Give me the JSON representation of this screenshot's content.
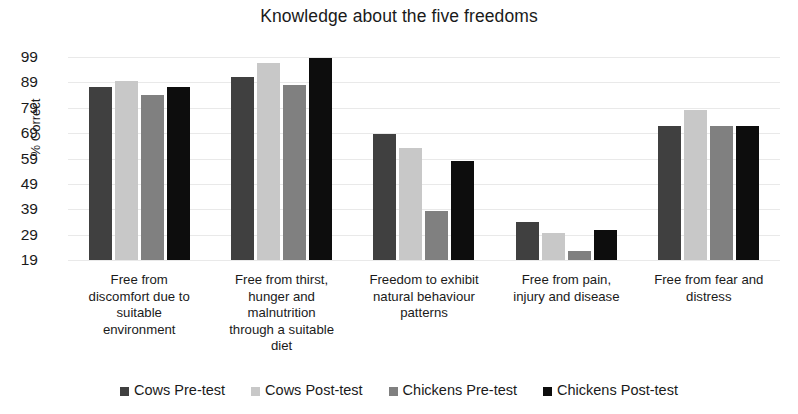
{
  "chart_data": {
    "type": "bar",
    "title": "Knowledge about the five freedoms",
    "xlabel": "",
    "ylabel": "% Correct",
    "ylim": [
      19,
      99
    ],
    "yticks": [
      19,
      29,
      39,
      49,
      59,
      69,
      79,
      89,
      99
    ],
    "grid": true,
    "legend_position": "bottom",
    "categories": [
      "Free from discomfort due to suitable environment",
      "Free from thirst, hunger and malnutrition through a suitable diet",
      "Freedom to exhibit natural behaviour patterns",
      "Free from pain, injury and disease",
      "Free from fear and distress"
    ],
    "category_lines": [
      [
        "Free from",
        "discomfort due to",
        "suitable",
        "environment"
      ],
      [
        "Free from thirst,",
        "hunger and",
        "malnutrition",
        "through a suitable",
        "diet"
      ],
      [
        "Freedom to exhibit",
        "natural behaviour",
        "patterns"
      ],
      [
        "Free from pain,",
        "injury and disease"
      ],
      [
        "Free from fear and",
        "distress"
      ]
    ],
    "series": [
      {
        "name": "Cows Pre-test",
        "color": "#404040",
        "values": [
          87,
          91,
          68.5,
          34,
          72
        ]
      },
      {
        "name": "Cows Post-test",
        "color": "#c8c8c8",
        "values": [
          89.5,
          96.5,
          63,
          29.5,
          78
        ]
      },
      {
        "name": "Chickens Pre-test",
        "color": "#808080",
        "values": [
          84,
          88,
          38.5,
          22.5,
          72
        ]
      },
      {
        "name": "Chickens Post-test",
        "color": "#0d0d0d",
        "values": [
          87,
          98.5,
          58,
          31,
          72
        ]
      }
    ]
  }
}
